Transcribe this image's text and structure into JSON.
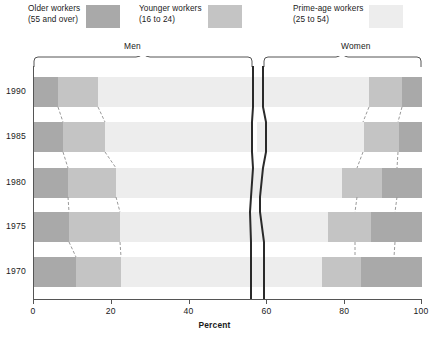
{
  "legend": {
    "items": [
      {
        "name": "older",
        "label_line1": "Older workers",
        "label_line2": "(55 and over)",
        "color": "#a9a9a9"
      },
      {
        "name": "younger",
        "label_line1": "Younger workers",
        "label_line2": "(16 to 24)",
        "color": "#c4c4c4"
      },
      {
        "name": "prime",
        "label_line1": "Prime-age workers",
        "label_line2": "(25 to 54)",
        "color": "#ededed"
      }
    ]
  },
  "groups": {
    "men": "Men",
    "women": "Women"
  },
  "axes": {
    "x_title": "Percent",
    "x_ticks": [
      "0",
      "20",
      "40",
      "60",
      "80",
      "100"
    ],
    "y_ticks": [
      "1990",
      "1985",
      "1980",
      "1975",
      "1970"
    ]
  },
  "chart_data": {
    "type": "bar",
    "title": "",
    "subtitle": "",
    "xlabel": "Percent",
    "ylabel": "",
    "xlim": [
      0,
      100
    ],
    "grid": false,
    "orientation": "horizontal",
    "stacked": true,
    "legend_position": "top",
    "categories": [
      "1990",
      "1985",
      "1980",
      "1975",
      "1970"
    ],
    "legend_entries": [
      "Older workers (55 and over)",
      "Younger workers (16 to 24)",
      "Prime-age workers (25 to 54)"
    ],
    "note": "Stacked shares of total labor force; Men stack left-to-right from 0, Women stack right-to-left from 100.",
    "series": [
      {
        "name": "Men - Older workers (55 and over)",
        "group": "Men",
        "color": "#a9a9a9",
        "values": [
          6.4,
          7.7,
          9.0,
          9.3,
          11.0
        ]
      },
      {
        "name": "Men - Younger workers (16 to 24)",
        "group": "Men",
        "color": "#c4c4c4",
        "values": [
          10.3,
          10.8,
          12.3,
          13.1,
          11.6
        ]
      },
      {
        "name": "Men - Prime-age workers (25 to 54)",
        "group": "Men",
        "color": "#ededed",
        "values": [
          39.9,
          37.8,
          35.0,
          33.3,
          33.5
        ]
      },
      {
        "name": "Women - Prime-age workers (25 to 54)",
        "group": "Women",
        "color": "#ededed",
        "values": [
          29.8,
          27.4,
          23.2,
          20.1,
          18.3
        ]
      },
      {
        "name": "Women - Younger workers (16 to 24)",
        "group": "Women",
        "color": "#c4c4c4",
        "values": [
          8.5,
          9.0,
          10.3,
          11.2,
          10.0
        ]
      },
      {
        "name": "Women - Older workers (55 and over)",
        "group": "Women",
        "color": "#a9a9a9",
        "values": [
          5.1,
          7.3,
          10.2,
          13.0,
          15.6
        ]
      }
    ],
    "men_totals": [
      56.6,
      56.3,
      56.3,
      55.7,
      56.1
    ],
    "women_totals": [
      43.4,
      43.7,
      43.7,
      44.3,
      43.9
    ],
    "men_segments": [
      {
        "year": "1990",
        "older": [
          0,
          6.4
        ],
        "younger": [
          6.4,
          16.7
        ],
        "prime": [
          16.7,
          56.6
        ]
      },
      {
        "year": "1985",
        "older": [
          0,
          7.7
        ],
        "younger": [
          7.7,
          18.5
        ],
        "prime": [
          18.5,
          56.3
        ]
      },
      {
        "year": "1980",
        "older": [
          0,
          9.0
        ],
        "younger": [
          9.0,
          21.3
        ],
        "prime": [
          21.3,
          56.3
        ]
      },
      {
        "year": "1975",
        "older": [
          0,
          9.3
        ],
        "younger": [
          9.3,
          22.4
        ],
        "prime": [
          22.4,
          55.7
        ]
      },
      {
        "year": "1970",
        "older": [
          0,
          11.0
        ],
        "younger": [
          11.0,
          22.6
        ],
        "prime": [
          22.6,
          56.1
        ]
      }
    ],
    "women_segments": [
      {
        "year": "1990",
        "prime": [
          56.6,
          86.4
        ],
        "younger": [
          86.4,
          94.9
        ],
        "older": [
          94.9,
          100
        ]
      },
      {
        "year": "1985",
        "prime": [
          57.7,
          85.1
        ],
        "younger": [
          85.1,
          94.1
        ],
        "older": [
          94.1,
          100
        ]
      },
      {
        "year": "1980",
        "prime": [
          56.3,
          79.5
        ],
        "younger": [
          79.5,
          89.8
        ],
        "older": [
          89.8,
          100
        ]
      },
      {
        "year": "1975",
        "prime": [
          55.7,
          75.8
        ],
        "younger": [
          75.8,
          87.0
        ],
        "older": [
          87.0,
          100
        ]
      },
      {
        "year": "1970",
        "prime": [
          56.1,
          74.4
        ],
        "younger": [
          74.4,
          84.4
        ],
        "older": [
          84.4,
          100
        ]
      }
    ]
  }
}
